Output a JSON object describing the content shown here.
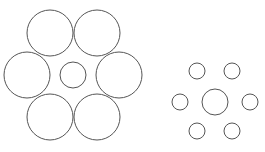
{
  "diagram": {
    "stroke_color": "#555555",
    "background": "#ffffff",
    "groups": [
      {
        "name": "large-surround",
        "center": {
          "cx": 73,
          "cy": 75,
          "r": 13
        },
        "surround": [
          {
            "cx": 50,
            "cy": 33,
            "r": 23
          },
          {
            "cx": 97,
            "cy": 33,
            "r": 23
          },
          {
            "cx": 27,
            "cy": 75,
            "r": 23
          },
          {
            "cx": 119,
            "cy": 75,
            "r": 23
          },
          {
            "cx": 50,
            "cy": 117,
            "r": 23
          },
          {
            "cx": 97,
            "cy": 117,
            "r": 23
          }
        ]
      },
      {
        "name": "small-surround",
        "center": {
          "cx": 215,
          "cy": 102,
          "r": 13
        },
        "surround": [
          {
            "cx": 197,
            "cy": 71,
            "r": 8
          },
          {
            "cx": 232,
            "cy": 71,
            "r": 8
          },
          {
            "cx": 180,
            "cy": 102,
            "r": 8
          },
          {
            "cx": 250,
            "cy": 102,
            "r": 8
          },
          {
            "cx": 197,
            "cy": 131,
            "r": 8
          },
          {
            "cx": 232,
            "cy": 131,
            "r": 8
          }
        ]
      }
    ]
  }
}
